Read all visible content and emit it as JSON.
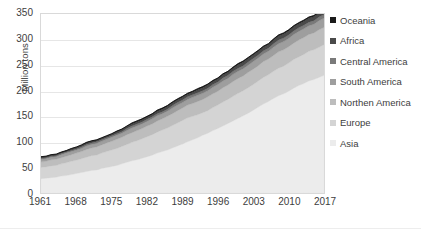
{
  "chart_data": {
    "type": "area",
    "stacked": true,
    "title": "",
    "subtitle": "",
    "xlabel": "",
    "ylabel": "Million tons",
    "ylim": [
      0,
      350
    ],
    "xlim": [
      1961,
      2017
    ],
    "y_ticks": [
      350,
      300,
      250,
      200,
      150,
      100,
      50,
      0
    ],
    "x_ticks": [
      1961,
      1968,
      1975,
      1982,
      1989,
      1996,
      2003,
      2010,
      2017
    ],
    "grid": true,
    "legend_position": "right",
    "x": [
      1961,
      1962,
      1963,
      1964,
      1965,
      1966,
      1967,
      1968,
      1969,
      1970,
      1971,
      1972,
      1973,
      1974,
      1975,
      1976,
      1977,
      1978,
      1979,
      1980,
      1981,
      1982,
      1983,
      1984,
      1985,
      1986,
      1987,
      1988,
      1989,
      1990,
      1991,
      1992,
      1993,
      1994,
      1995,
      1996,
      1997,
      1998,
      1999,
      2000,
      2001,
      2002,
      2003,
      2004,
      2005,
      2006,
      2007,
      2008,
      2009,
      2010,
      2011,
      2012,
      2013,
      2014,
      2015,
      2016,
      2017
    ],
    "series": [
      {
        "name": "Asia",
        "color": "#ececec",
        "values": [
          28,
          29,
          30,
          31,
          33,
          34,
          36,
          38,
          40,
          42,
          44,
          45,
          48,
          50,
          52,
          54,
          57,
          60,
          63,
          65,
          68,
          71,
          74,
          78,
          81,
          84,
          88,
          92,
          96,
          100,
          104,
          108,
          113,
          117,
          122,
          126,
          131,
          136,
          141,
          146,
          151,
          156,
          162,
          168,
          174,
          179,
          185,
          190,
          194,
          199,
          205,
          210,
          214,
          219,
          222,
          226,
          230
        ]
      },
      {
        "name": "Europe",
        "color": "#d4d4d4",
        "values": [
          22,
          22,
          23,
          23,
          24,
          25,
          26,
          26,
          27,
          28,
          29,
          29,
          30,
          31,
          32,
          33,
          34,
          35,
          36,
          37,
          38,
          39,
          40,
          41,
          42,
          43,
          44,
          45,
          46,
          47,
          46,
          45,
          44,
          44,
          45,
          46,
          47,
          47,
          48,
          49,
          49,
          50,
          50,
          51,
          52,
          52,
          53,
          54,
          54,
          55,
          56,
          56,
          57,
          58,
          58,
          59,
          60
        ]
      },
      {
        "name": "Northen America",
        "color": "#bdbdbd",
        "values": [
          11,
          11,
          12,
          12,
          12,
          13,
          13,
          14,
          14,
          15,
          15,
          16,
          16,
          17,
          17,
          18,
          18,
          19,
          19,
          20,
          20,
          21,
          21,
          22,
          22,
          23,
          23,
          24,
          24,
          25,
          25,
          26,
          26,
          27,
          27,
          27,
          28,
          28,
          29,
          29,
          29,
          30,
          30,
          30,
          31,
          31,
          31,
          32,
          32,
          32,
          32,
          33,
          33,
          33,
          33,
          34,
          34
        ]
      },
      {
        "name": "South America",
        "color": "#9e9e9e",
        "values": [
          5,
          5,
          5,
          5,
          6,
          6,
          6,
          6,
          6,
          7,
          7,
          7,
          7,
          7,
          8,
          8,
          8,
          8,
          9,
          9,
          9,
          9,
          10,
          10,
          10,
          10,
          11,
          11,
          11,
          11,
          12,
          12,
          12,
          12,
          13,
          13,
          13,
          13,
          14,
          14,
          14,
          14,
          15,
          15,
          15,
          15,
          16,
          16,
          16,
          16,
          17,
          17,
          17,
          17,
          17,
          18,
          18
        ]
      },
      {
        "name": "Central America",
        "color": "#7a7a7a",
        "values": [
          2,
          2,
          2,
          2,
          2,
          2,
          2,
          2,
          3,
          3,
          3,
          3,
          3,
          3,
          3,
          3,
          3,
          4,
          4,
          4,
          4,
          4,
          4,
          4,
          4,
          4,
          5,
          5,
          5,
          5,
          5,
          5,
          5,
          5,
          5,
          5,
          6,
          6,
          6,
          6,
          6,
          6,
          6,
          6,
          6,
          6,
          7,
          7,
          7,
          7,
          7,
          7,
          7,
          7,
          7,
          7,
          7
        ]
      },
      {
        "name": "Africa",
        "color": "#4a4a4a",
        "values": [
          2,
          2,
          2,
          2,
          2,
          2,
          3,
          3,
          3,
          3,
          3,
          3,
          3,
          3,
          3,
          4,
          4,
          4,
          4,
          4,
          4,
          4,
          4,
          5,
          5,
          5,
          5,
          5,
          5,
          5,
          5,
          6,
          6,
          6,
          6,
          6,
          6,
          6,
          6,
          7,
          7,
          7,
          7,
          7,
          7,
          7,
          7,
          8,
          8,
          8,
          8,
          8,
          8,
          8,
          8,
          8,
          8
        ]
      },
      {
        "name": "Oceania",
        "color": "#1a1a1a",
        "values": [
          1,
          1,
          1,
          1,
          1,
          1,
          1,
          1,
          1,
          1,
          1,
          1,
          1,
          1,
          1,
          1,
          1,
          1,
          2,
          2,
          2,
          2,
          2,
          2,
          2,
          2,
          2,
          2,
          2,
          2,
          2,
          2,
          2,
          2,
          2,
          2,
          2,
          2,
          2,
          2,
          2,
          2,
          2,
          2,
          2,
          2,
          2,
          2,
          2,
          2,
          2,
          2,
          2,
          2,
          2,
          2,
          2
        ]
      }
    ]
  },
  "axis": {
    "y_title": "Million tons",
    "y_labels": [
      "350",
      "300",
      "250",
      "200",
      "150",
      "100",
      "50",
      "0"
    ],
    "x_labels": [
      "1961",
      "1968",
      "1975",
      "1982",
      "1989",
      "1996",
      "2003",
      "2010",
      "2017"
    ]
  },
  "legend": {
    "items": [
      {
        "label": "Oceania",
        "color": "#1a1a1a"
      },
      {
        "label": "Africa",
        "color": "#4a4a4a"
      },
      {
        "label": "Central America",
        "color": "#7a7a7a"
      },
      {
        "label": "South America",
        "color": "#9e9e9e"
      },
      {
        "label": "Northen America",
        "color": "#bdbdbd"
      },
      {
        "label": "Europe",
        "color": "#d4d4d4"
      },
      {
        "label": "Asia",
        "color": "#ececec"
      }
    ]
  }
}
